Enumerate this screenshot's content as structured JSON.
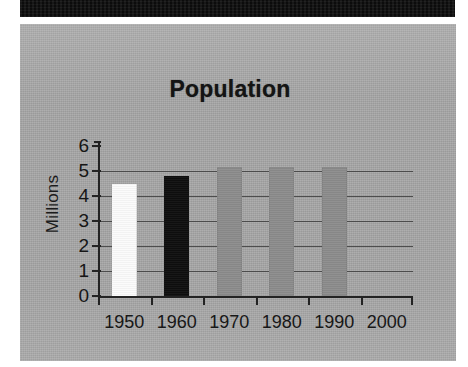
{
  "page": {
    "background": "#ffffff",
    "plate_color": "#a6a6a6",
    "scan_band_color": "#0c0c0c"
  },
  "chart_data": {
    "type": "bar",
    "title": "Population",
    "xlabel": "",
    "ylabel": "Millions",
    "categories": [
      "1950",
      "1960",
      "1970",
      "1980",
      "1990",
      "2000"
    ],
    "values": [
      4.5,
      4.8,
      5.15,
      5.15,
      5.15,
      null
    ],
    "bar_colors": [
      "#fbfbfb",
      "#0e0e0e",
      "#8c8c8c",
      "#8c8c8c",
      "#8c8c8c",
      null
    ],
    "ylim": [
      0,
      6
    ],
    "yticks": [
      "0",
      "1",
      "2",
      "3",
      "4",
      "5",
      "6"
    ],
    "ytick_values": [
      0,
      1,
      2,
      3,
      4,
      5,
      6
    ],
    "grid": true,
    "grid_axis": "y",
    "legend": null,
    "legend_position": "none",
    "annotations": []
  }
}
